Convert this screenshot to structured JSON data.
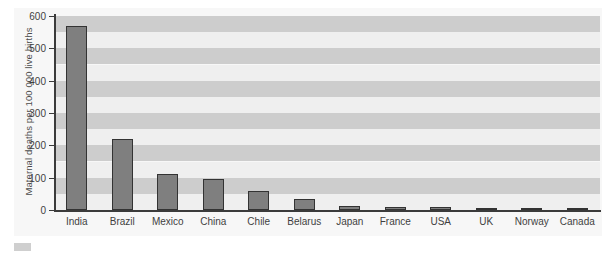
{
  "chart_data": {
    "type": "bar",
    "title": "",
    "xlabel": "",
    "ylabel": "Maternal deaths per 100 000 live births",
    "categories": [
      "India",
      "Brazil",
      "Mexico",
      "China",
      "Chile",
      "Belarus",
      "Japan",
      "France",
      "USA",
      "UK",
      "Norway",
      "Canada"
    ],
    "values": [
      570,
      220,
      110,
      95,
      60,
      33,
      12,
      10,
      8,
      7,
      5,
      4
    ],
    "ylim": [
      0,
      600
    ],
    "yticks": [
      0,
      100,
      200,
      300,
      400,
      500,
      600
    ],
    "ytick_labels": [
      "0",
      "100",
      "200",
      "300",
      "400",
      "500",
      "600"
    ],
    "grid": "horizontal-alternating-bands",
    "band_interval": 50,
    "legend": null,
    "series": [
      {
        "name": "Maternal deaths per 100 000 live births",
        "values": [
          570,
          220,
          110,
          95,
          60,
          33,
          12,
          10,
          8,
          7,
          5,
          4
        ]
      }
    ]
  },
  "style": {
    "bar_fill": "#7f7f7f",
    "bar_stroke": "#333333",
    "axis_color": "#3b3b3b",
    "band_light": "#efefef",
    "band_dark": "#cdcdcd",
    "panel_bg": "#f7f7f7",
    "text_color": "#3f3f3f"
  }
}
